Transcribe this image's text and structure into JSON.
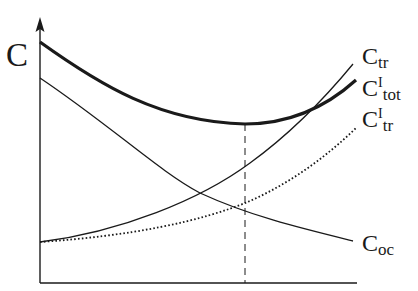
{
  "diagram": {
    "type": "cost-curves",
    "y_axis_label": "C",
    "curves": [
      {
        "id": "c_tr",
        "label_main": "C",
        "label_sup": "",
        "label_sub": "tr",
        "style": "thin-solid"
      },
      {
        "id": "c_tot_I",
        "label_main": "C",
        "label_sup": "I",
        "label_sub": "tot",
        "style": "thick-solid"
      },
      {
        "id": "c_tr_I",
        "label_main": "C",
        "label_sup": "I",
        "label_sub": "tr",
        "style": "dotted"
      },
      {
        "id": "c_oc",
        "label_main": "C",
        "label_sup": "",
        "label_sub": "oc",
        "style": "thin-solid"
      }
    ],
    "optimum_marker": "dashed vertical line at minimum of total cost",
    "colors": {
      "ink": "#1a1a1a",
      "background": "#ffffff"
    }
  }
}
